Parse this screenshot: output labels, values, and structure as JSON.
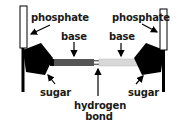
{
  "diagram": {
    "labels": {
      "phosphate_left": "phosphate",
      "phosphate_right": "phosphate",
      "base_left": "base",
      "base_right": "base",
      "sugar_left": "sugar",
      "sugar_right": "sugar",
      "hydrogen_line1": "hydrogen",
      "hydrogen_line2": "bond"
    },
    "colors": {
      "phosphate_fill": "#ffffff",
      "outline": "#000000",
      "sugar_fill": "#000000",
      "base_left_fill": "#555555",
      "base_right_fill": "#d8d8d8",
      "background": "#ffffff"
    }
  }
}
